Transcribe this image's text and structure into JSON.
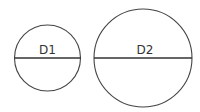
{
  "diagram": {
    "title": "",
    "circles": [
      {
        "label": "D1",
        "cx": 47.5,
        "cy": 58,
        "r": 33
      },
      {
        "label": "D2",
        "cx": 143,
        "cy": 58,
        "r": 49
      }
    ],
    "stroke_color": "#444444",
    "background": "#ffffff"
  }
}
